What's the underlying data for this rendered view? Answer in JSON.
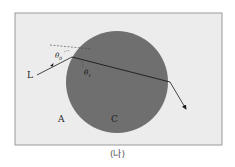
{
  "labels": {
    "light": "L",
    "region_outside": "A",
    "region_inside": "C",
    "angle_incidence": "θ",
    "angle_incidence_sub": "0",
    "angle_refraction": "θ",
    "angle_refraction_sub": "1"
  },
  "caption": "(나)",
  "colors": {
    "background": "#ececec",
    "border": "#9a9a9a",
    "sphere": "#6f6f6f",
    "ray": "#1a1a1a"
  }
}
